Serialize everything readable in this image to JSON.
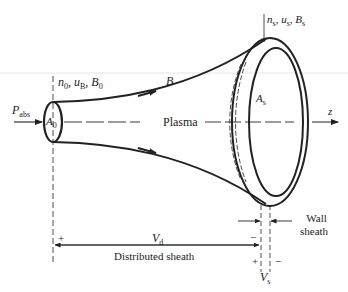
{
  "diagram": {
    "kind": "plasma expansion schematic",
    "colors": {
      "ink": "#222222",
      "background": "#ffffff",
      "faint_line": "#e6e6e6"
    },
    "labels": {
      "inlet_state": {
        "n": "n",
        "n_sub": "0",
        "u": "u",
        "u_sub": "B",
        "B": "B",
        "B_sub": "0",
        "sep": ", "
      },
      "outlet_state": {
        "n": "n",
        "n_sub": "s",
        "u": "u",
        "u_sub": "s",
        "B": "B",
        "B_sub": "s",
        "sep": ", "
      },
      "field_line": "B",
      "power_in": {
        "main": "P",
        "sub": "abs"
      },
      "inlet_area": {
        "main": "A",
        "sub": "0"
      },
      "outlet_area": {
        "main": "A",
        "sub": "s"
      },
      "axis_center": "Plasma",
      "axis_label": "z",
      "distributed_voltage": {
        "main": "V",
        "sub": "d"
      },
      "distributed_sheath": "Distributed sheath",
      "wall_sheath_line1": "Wall",
      "wall_sheath_line2": "sheath",
      "sheath_voltage": {
        "main": "V",
        "sub": "s"
      },
      "plus_left": "+",
      "minus_mid": "−",
      "plus_bottom": "+",
      "minus_bottom": "−"
    }
  }
}
